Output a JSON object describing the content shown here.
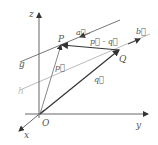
{
  "diagram": {
    "type": "3d-vector-geometry",
    "axes": {
      "x_label": "x",
      "y_label": "y",
      "z_label": "z",
      "origin_label": "O"
    },
    "points": [
      {
        "id": "P",
        "label": "P"
      },
      {
        "id": "Q",
        "label": "Q"
      }
    ],
    "lines": [
      {
        "id": "g",
        "label": "g",
        "direction_label": "a⃗"
      },
      {
        "id": "h",
        "label": "h",
        "direction_label": "b⃗"
      }
    ],
    "vectors": [
      {
        "id": "p",
        "label": "p⃗",
        "from": "O",
        "to": "P"
      },
      {
        "id": "q",
        "label": "q⃗",
        "from": "O",
        "to": "Q"
      },
      {
        "id": "p_minus_q",
        "label": "p⃗ - q⃗",
        "from": "Q",
        "to": "P"
      }
    ],
    "colors": {
      "dark": "#333333",
      "axis": "#666666",
      "line": "#777777",
      "light_line": "#bbbbbb"
    }
  }
}
